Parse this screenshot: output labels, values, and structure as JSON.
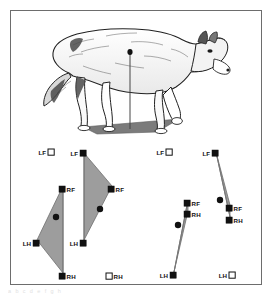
{
  "figure": {
    "frame_color": "#6d6d6d",
    "background": "#ffffff",
    "caption_ghost": "a   b   c   d   e   f   g   h"
  },
  "illustration": {
    "name": "wolf-walking-illustration",
    "description": "Line-art wolf standing on a shaded support polygon with a vertical center-of-gravity line",
    "ground_polygon_color": "#7b7b7b",
    "cg_line_color": "#444444",
    "cg_dot_color": "#111111",
    "outline_color": "#222222",
    "fill_color": "#ffffff"
  },
  "legend": {
    "filled_meaning": "foot in support (filled square)",
    "open_meaning": "foot lifted (open square)",
    "filled_color": "#111111",
    "open_fill": "#ffffff",
    "open_stroke": "#111111",
    "polygon_fill": "#9d9d9d",
    "polygon_stroke": "#6f6f6f",
    "cg_marker_color": "#111111"
  },
  "panels": [
    {
      "id": "panel-1",
      "name": "support-pattern-tripod-left-fore-lifted",
      "support_type": "triangle",
      "cg": {
        "x": 45,
        "y": 78,
        "r": 3.2
      },
      "polygon": [
        [
          52,
          47
        ],
        [
          26,
          101
        ],
        [
          52,
          134
        ]
      ],
      "feet": [
        {
          "code": "LF",
          "label": "LF",
          "state": "open",
          "x": 37,
          "y": 10,
          "label_side": "left"
        },
        {
          "code": "RF",
          "label": "RF",
          "state": "filled",
          "x": 48,
          "y": 47,
          "label_side": "right"
        },
        {
          "code": "LH",
          "label": "LH",
          "state": "filled",
          "x": 22,
          "y": 101,
          "label_side": "left"
        },
        {
          "code": "RH",
          "label": "RH",
          "state": "filled",
          "x": 48,
          "y": 134,
          "label_side": "right"
        }
      ],
      "support_line": {
        "x1": 52,
        "y1": 47,
        "x2": 52,
        "y2": 134
      }
    },
    {
      "id": "panel-2",
      "name": "support-pattern-tripod-right-hind-lifted",
      "support_type": "triangle",
      "cg": {
        "x": 89,
        "y": 70,
        "r": 3.2
      },
      "polygon": [
        [
          73,
          14
        ],
        [
          101,
          47
        ],
        [
          73,
          101
        ]
      ],
      "feet": [
        {
          "code": "LF",
          "label": "LF",
          "state": "filled",
          "x": 69,
          "y": 11,
          "label_side": "left"
        },
        {
          "code": "RF",
          "label": "RF",
          "state": "filled",
          "x": 97,
          "y": 47,
          "label_side": "right"
        },
        {
          "code": "LH",
          "label": "LH",
          "state": "filled",
          "x": 69,
          "y": 101,
          "label_side": "left"
        },
        {
          "code": "RH",
          "label": "RH",
          "state": "open",
          "x": 95,
          "y": 134,
          "label_side": "right"
        }
      ],
      "support_line": {
        "x1": 73,
        "y1": 14,
        "x2": 73,
        "y2": 101
      }
    },
    {
      "id": "panel-3",
      "name": "support-pattern-diagonal-narrow-left-fore-lifted",
      "support_type": "narrow",
      "cg": {
        "x": 167,
        "y": 86,
        "r": 3.2
      },
      "polygon": [
        [
          177,
          61
        ],
        [
          177,
          72
        ],
        [
          163,
          133
        ]
      ],
      "feet": [
        {
          "code": "LF",
          "label": "LF",
          "state": "open",
          "x": 155,
          "y": 10,
          "label_side": "left"
        },
        {
          "code": "RF",
          "label": "RF",
          "state": "filled",
          "x": 173,
          "y": 61,
          "label_side": "right"
        },
        {
          "code": "RH",
          "label": "RH",
          "state": "filled",
          "x": 173,
          "y": 72,
          "label_side": "right"
        },
        {
          "code": "LH",
          "label": "LH",
          "state": "filled",
          "x": 159,
          "y": 133,
          "label_side": "left"
        }
      ],
      "support_line": {
        "x1": 177,
        "y1": 61,
        "x2": 163,
        "y2": 133
      }
    },
    {
      "id": "panel-4",
      "name": "support-pattern-diagonal-narrow-left-hind-lifted",
      "support_type": "narrow",
      "cg": {
        "x": 209,
        "y": 61,
        "r": 3.2
      },
      "polygon": [
        [
          205,
          13
        ],
        [
          219,
          66
        ],
        [
          219,
          78
        ]
      ],
      "feet": [
        {
          "code": "LF",
          "label": "LF",
          "state": "filled",
          "x": 201,
          "y": 11,
          "label_side": "left"
        },
        {
          "code": "RF",
          "label": "RF",
          "state": "filled",
          "x": 215,
          "y": 66,
          "label_side": "right"
        },
        {
          "code": "RH",
          "label": "RH",
          "state": "filled",
          "x": 215,
          "y": 78,
          "label_side": "right"
        },
        {
          "code": "LH",
          "label": "LH",
          "state": "open",
          "x": 218,
          "y": 133,
          "label_side": "left"
        }
      ],
      "support_line": {
        "x1": 205,
        "y1": 13,
        "x2": 219,
        "y2": 78
      }
    }
  ]
}
